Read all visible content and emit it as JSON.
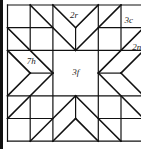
{
  "diagram": {
    "grid": {
      "columns": 6,
      "rows": 6
    },
    "line_color": "#111111",
    "labels": [
      {
        "id": "top-arm",
        "text": "2r",
        "col": 2.75,
        "row": 0.45
      },
      {
        "id": "top-right-corner",
        "text": "3c",
        "col": 5.15,
        "row": 0.65
      },
      {
        "id": "right-arm",
        "text": "2n",
        "col": 5.5,
        "row": 1.85
      },
      {
        "id": "left-arm",
        "text": "7h",
        "col": 0.85,
        "row": 2.45
      },
      {
        "id": "center",
        "text": "3f",
        "col": 2.85,
        "row": 2.95
      }
    ],
    "segments": [
      [
        0,
        0,
        6,
        0
      ],
      [
        0,
        6,
        6,
        6
      ],
      [
        0,
        0,
        0,
        6
      ],
      [
        6,
        0,
        6,
        6
      ],
      [
        1,
        0,
        1,
        2
      ],
      [
        1,
        4,
        1,
        6
      ],
      [
        2,
        0,
        2,
        6
      ],
      [
        4,
        0,
        4,
        6
      ],
      [
        5,
        0,
        5,
        2
      ],
      [
        5,
        4,
        5,
        6
      ],
      [
        3,
        1,
        3,
        2
      ],
      [
        3,
        4,
        3,
        5
      ],
      [
        0,
        1,
        2,
        1
      ],
      [
        4,
        1,
        6,
        1
      ],
      [
        0,
        2,
        6,
        2
      ],
      [
        0,
        4,
        6,
        4
      ],
      [
        0,
        5,
        2,
        5
      ],
      [
        4,
        5,
        6,
        5
      ],
      [
        1,
        3,
        2,
        3
      ],
      [
        4,
        3,
        5,
        3
      ],
      [
        1,
        0,
        3,
        2
      ],
      [
        2,
        0,
        3,
        1
      ],
      [
        4,
        0,
        3,
        1
      ],
      [
        5,
        0,
        3,
        2
      ],
      [
        0,
        1,
        2,
        3
      ],
      [
        0,
        2,
        1,
        3
      ],
      [
        0,
        4,
        1,
        3
      ],
      [
        0,
        5,
        2,
        3
      ],
      [
        6,
        1,
        4,
        3
      ],
      [
        6,
        2,
        5,
        3
      ],
      [
        6,
        4,
        5,
        3
      ],
      [
        6,
        5,
        4,
        3
      ],
      [
        1,
        6,
        3,
        4
      ],
      [
        2,
        6,
        3,
        5
      ],
      [
        4,
        6,
        3,
        5
      ],
      [
        5,
        6,
        3,
        4
      ]
    ]
  }
}
